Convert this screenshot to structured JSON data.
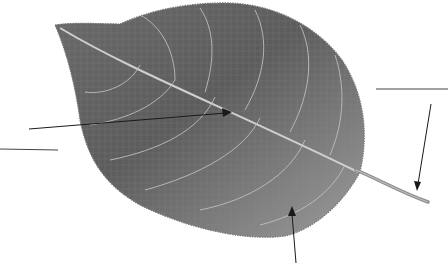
{
  "figure": {
    "colors": {
      "background": "#ffffff",
      "leaf_dark": "#5e5e5e",
      "leaf_mid": "#7a7a7a",
      "leaf_light": "#9a9a9a",
      "vein": "#c8c8c8",
      "line": "#1a1a1a"
    }
  },
  "labels": [
    {
      "id": "midrib",
      "text": "",
      "blank_line": true,
      "points_to": "midrib"
    },
    {
      "id": "petiole",
      "text": "",
      "blank_line": true,
      "points_to": "petiole"
    },
    {
      "id": "blade",
      "text": "",
      "blank_line": false,
      "points_to": "leaf blade"
    },
    {
      "id": "extra-blank",
      "text": "",
      "blank_line": true,
      "points_to": ""
    }
  ]
}
